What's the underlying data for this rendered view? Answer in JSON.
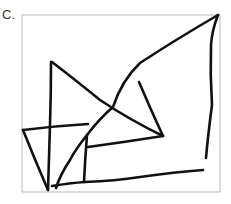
{
  "figure": {
    "label": "C.",
    "frame_color": "#b8b8b8",
    "stroke_color": "#111111"
  }
}
